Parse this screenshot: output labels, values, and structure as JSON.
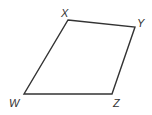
{
  "diagram": {
    "type": "quadrilateral",
    "stroke_color": "#333333",
    "background": "#ffffff",
    "vertices": [
      {
        "name": "X",
        "x": 68,
        "y": 20,
        "label_x": 61,
        "label_y": 17
      },
      {
        "name": "Y",
        "x": 135,
        "y": 27,
        "label_x": 137,
        "label_y": 27
      },
      {
        "name": "Z",
        "x": 112,
        "y": 94,
        "label_x": 113,
        "label_y": 107
      },
      {
        "name": "W",
        "x": 24,
        "y": 94,
        "label_x": 9,
        "label_y": 107
      }
    ],
    "labels": {
      "x": "X",
      "y": "Y",
      "z": "Z",
      "w": "W"
    }
  }
}
